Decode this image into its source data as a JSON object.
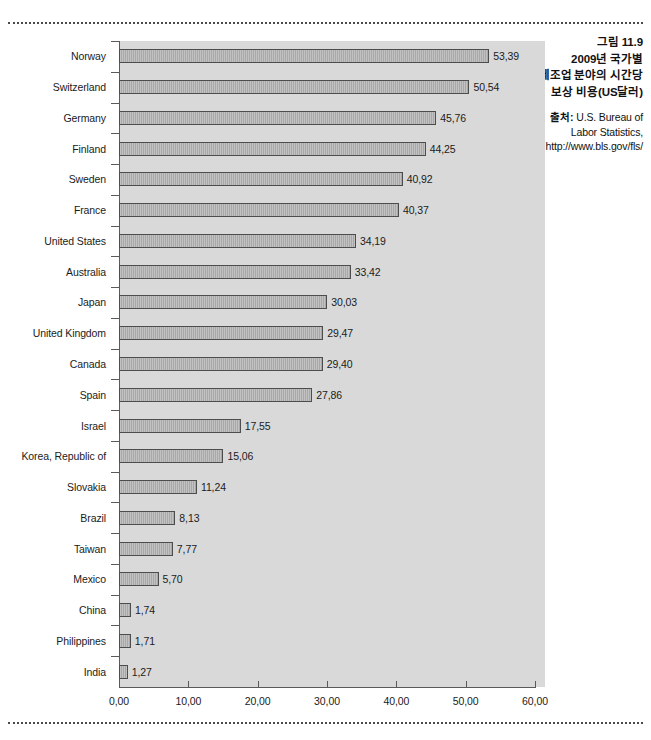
{
  "caption": {
    "figure_number": "그림 11.9",
    "title_lines": [
      "2009년 국가별",
      "제조업 분야의 시간당",
      "보상 비용(US달러)"
    ],
    "source_label": "출처:",
    "source_text": " U.S. Bureau of Labor Statistics, http://www.bls.gov/fls/"
  },
  "chart_data": {
    "type": "bar",
    "orientation": "horizontal",
    "title": "2009년 국가별 제조업 분야의 시간당 보상 비용(US달러)",
    "xlabel": "",
    "ylabel": "",
    "xlim": [
      0,
      60
    ],
    "xticks": [
      0,
      10,
      20,
      30,
      40,
      50,
      60
    ],
    "xtick_labels": [
      "0,00",
      "10,00",
      "20,00",
      "30,00",
      "40,00",
      "50,00",
      "60,00"
    ],
    "decimal_separator": ",",
    "grid": false,
    "legend": false,
    "plot_background": "#d9d9d9",
    "bar_fill": "#a8a8a8",
    "bar_edge": "#4d4d4d",
    "categories": [
      "Norway",
      "Switzerland",
      "Germany",
      "Finland",
      "Sweden",
      "France",
      "United States",
      "Australia",
      "Japan",
      "United Kingdom",
      "Canada",
      "Spain",
      "Israel",
      "Korea, Republic of",
      "Slovakia",
      "Brazil",
      "Taiwan",
      "Mexico",
      "China",
      "Philippines",
      "India"
    ],
    "values": [
      53.39,
      50.54,
      45.76,
      44.25,
      40.92,
      40.37,
      34.19,
      33.42,
      30.03,
      29.47,
      29.4,
      27.86,
      17.55,
      15.06,
      11.24,
      8.13,
      7.77,
      5.7,
      1.74,
      1.71,
      1.27
    ],
    "value_labels": [
      "53,39",
      "50,54",
      "45,76",
      "44,25",
      "40,92",
      "40,37",
      "34,19",
      "33,42",
      "30,03",
      "29,47",
      "29,40",
      "27,86",
      "17,55",
      "15,06",
      "11,24",
      "8,13",
      "7,77",
      "5,70",
      "1,74",
      "1,71",
      "1,27"
    ]
  }
}
